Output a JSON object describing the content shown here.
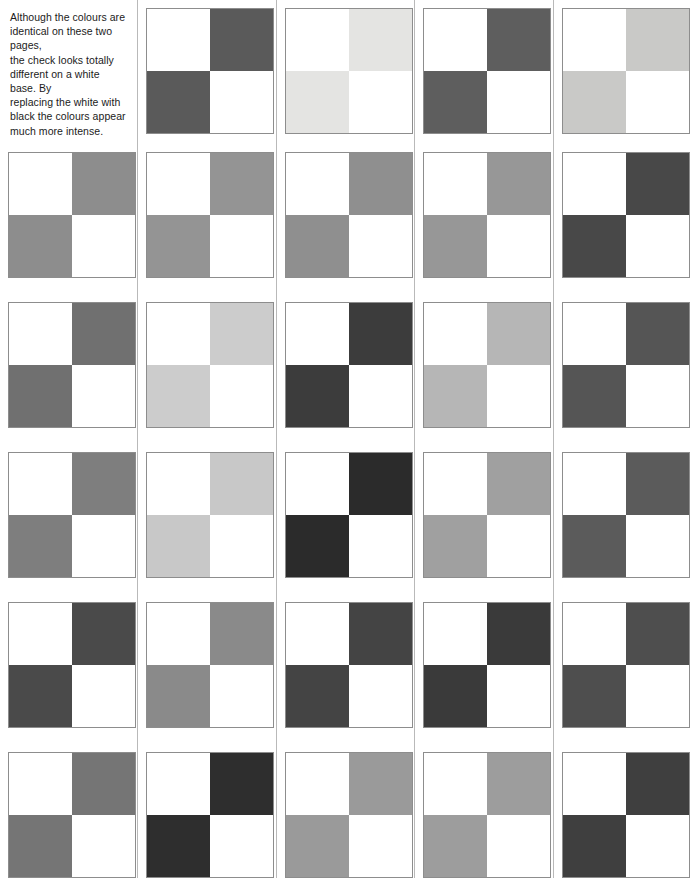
{
  "page": {
    "background_color": "#ffffff",
    "divider_color": "#b9b9b9",
    "tile_border_color": "#8d8d8d",
    "white_color": "#ffffff"
  },
  "intro": {
    "text": "Although the colours are identical on these two pages, the check looks totally different on a white base. By replacing the white with black  the colours appear much more intense.",
    "lines": [
      "Although the colours are",
      "identical on these two pages,",
      "the check looks totally",
      "different on a white base. By",
      "replacing the white with",
      "black  the colours appear",
      "much more intense."
    ]
  },
  "grid": {
    "rows": 6,
    "columns": 5,
    "first_slot_is_text": true,
    "tile_pattern": "white top-left, colour top-right, colour bottom-left, white bottom-right",
    "column_x": [
      8,
      146,
      285,
      423,
      562
    ],
    "row_y": [
      8,
      152,
      302,
      452,
      602,
      752
    ],
    "tile_width": 128,
    "tile_height": 126,
    "divider_x": [
      137,
      276,
      414,
      553
    ]
  },
  "chart_data": {
    "type": "heatmap",
    "xlabel": "column",
    "ylabel": "row",
    "categories": [
      "col 1",
      "col 2",
      "col 3",
      "col 4",
      "col 5"
    ],
    "row_labels": [
      "row 1",
      "row 2",
      "row 3",
      "row 4",
      "row 5",
      "row 6"
    ],
    "grid": true,
    "legend": "none",
    "cells": [
      [
        {
          "type": "text",
          "swatch": null
        },
        {
          "type": "tile",
          "swatch": "#5a5a5a"
        },
        {
          "type": "tile",
          "swatch": "#e4e4e2"
        },
        {
          "type": "tile",
          "swatch": "#5e5e5e"
        },
        {
          "type": "tile",
          "swatch": "#c9c9c7"
        }
      ],
      [
        {
          "type": "tile",
          "swatch": "#8d8d8d"
        },
        {
          "type": "tile",
          "swatch": "#949494"
        },
        {
          "type": "tile",
          "swatch": "#8f8f8f"
        },
        {
          "type": "tile",
          "swatch": "#979797"
        },
        {
          "type": "tile",
          "swatch": "#484848"
        }
      ],
      [
        {
          "type": "tile",
          "swatch": "#707070"
        },
        {
          "type": "tile",
          "swatch": "#cccccc"
        },
        {
          "type": "tile",
          "swatch": "#3c3c3c"
        },
        {
          "type": "tile",
          "swatch": "#b6b6b6"
        },
        {
          "type": "tile",
          "swatch": "#555555"
        }
      ],
      [
        {
          "type": "tile",
          "swatch": "#7e7e7e"
        },
        {
          "type": "tile",
          "swatch": "#c8c8c8"
        },
        {
          "type": "tile",
          "swatch": "#2b2b2b"
        },
        {
          "type": "tile",
          "swatch": "#a0a0a0"
        },
        {
          "type": "tile",
          "swatch": "#5b5b5b"
        }
      ],
      [
        {
          "type": "tile",
          "swatch": "#4a4a4a"
        },
        {
          "type": "tile",
          "swatch": "#8a8a8a"
        },
        {
          "type": "tile",
          "swatch": "#444444"
        },
        {
          "type": "tile",
          "swatch": "#3a3a3a"
        },
        {
          "type": "tile",
          "swatch": "#4e4e4e"
        }
      ],
      [
        {
          "type": "tile",
          "swatch": "#757575"
        },
        {
          "type": "tile",
          "swatch": "#2e2e2e"
        },
        {
          "type": "tile",
          "swatch": "#9a9a9a"
        },
        {
          "type": "tile",
          "swatch": "#9d9d9d"
        },
        {
          "type": "tile",
          "swatch": "#3f3f3f"
        }
      ]
    ]
  }
}
